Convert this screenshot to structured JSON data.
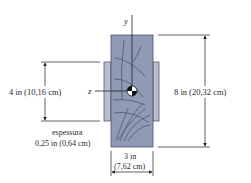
{
  "figure": {
    "axes": {
      "y_label": "y",
      "z_label": "z"
    },
    "dimensions": {
      "flange_height": "4 in (10,16 cm)",
      "beam_height": "8 in (20,32 cm)",
      "beam_width_line1": "3 in",
      "beam_width_line2": "(7,62 cm)",
      "thickness_line1": "espessura",
      "thickness_line2": "0,25 in (0,64 cm)"
    },
    "colors": {
      "beam_fill": "#8f9bb5",
      "beam_stroke": "#4a5270",
      "plate_fill": "#b9bfcf",
      "line": "#222222",
      "grain": "#3a4160"
    }
  }
}
